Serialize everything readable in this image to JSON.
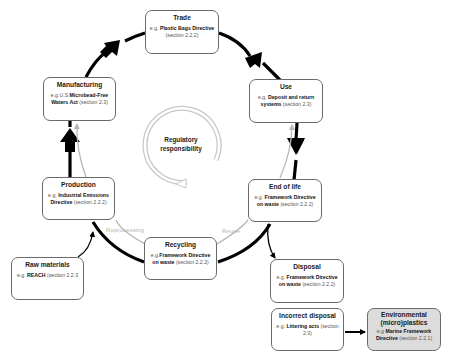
{
  "diagram": {
    "center": {
      "label": "Regulatory responsibility",
      "line1": "Regulatory",
      "line2": "responsibility"
    },
    "nodes": {
      "trade": {
        "title": "Trade",
        "eg": "e.g. ",
        "law": "Plastic Bags Directive",
        "section": "(section 2.2.2)"
      },
      "use": {
        "title": "Use",
        "eg": "e.g. ",
        "law": "Deposit and return systems",
        "section": "(section 2.3)"
      },
      "end_of_life": {
        "title": "End of life",
        "eg": "e.g. ",
        "law": "Framework Directive on waste",
        "section": "(section 2.2.2)"
      },
      "recycling": {
        "title": "Recycling",
        "eg": "e.g.",
        "law": "Framework Directive on waste",
        "section": "(section 2.2.2)"
      },
      "production": {
        "title": "Production",
        "eg": "e.g. ",
        "law": "Industrial Emissions Directive",
        "section": "(section 2.2.2)"
      },
      "manufacturing": {
        "title": "Manufacturing",
        "eg": "e.g.U.S ",
        "law": "Microbead-Free Waters Act",
        "section": "(section 2.3)"
      },
      "raw_materials": {
        "title": "Raw materials",
        "eg": "e.g. ",
        "law": "REACH",
        "section": "(section 2.2.3"
      },
      "disposal": {
        "title": "Disposal",
        "eg": "e.g. ",
        "law": "Framework Directive on waste",
        "section": "(section 2.2.2)"
      },
      "incorrect_disposal": {
        "title": "Incorrect disposal",
        "eg": "e.g. ",
        "law": "Littering acts",
        "section": "(section 2.3)"
      },
      "environmental": {
        "title": "Environmental (micro)plastics",
        "eg": "e.g ",
        "law": "Marine Framework Directive",
        "section": "(section 2.2.1)"
      }
    },
    "flow_labels": {
      "reprocessing": "Reprocessing",
      "reuse": "Reuse"
    },
    "colors": {
      "main_flow": "#000000",
      "secondary_flow": "#b8b8b8",
      "box_border": "#6a6a6a",
      "env_fill": "#dcdcdc"
    }
  }
}
